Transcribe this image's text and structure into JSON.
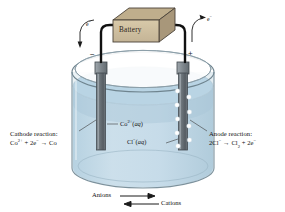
{
  "figure": {
    "background_color": "#ffffff"
  },
  "battery": {
    "label": "Battery",
    "face_color": "#cfc0a0",
    "top_color": "#bfae8c",
    "side_color": "#a8977a",
    "outline_color": "#4a4238"
  },
  "electron_flow": {
    "left_label": "e",
    "left_superscript": "−",
    "right_label": "e",
    "right_superscript": "−"
  },
  "terminals": {
    "negative": "−",
    "positive": "+"
  },
  "electrodes": {
    "cathode": {
      "name": "Cathode",
      "color": "#6e767c",
      "bubbles": false
    },
    "anode": {
      "name": "Anode",
      "color": "#6e767c",
      "bubbles": true,
      "bubble_color": "#ffffff",
      "bubble_count": 9
    }
  },
  "reactions": {
    "cathode": {
      "title": "Cathode reaction:",
      "equation_html": "Co<sup>2+</sup> + 2e<sup>−</sup> → Co",
      "equation_text": "Co2+ + 2e- → Co"
    },
    "anode": {
      "title": "Anode reaction:",
      "equation_html": "2Cl<sup>−</sup> → Cl<sub>2</sub> + 2e<sup>−</sup>",
      "equation_text": "2Cl- → Cl2 + 2e-"
    }
  },
  "solution": {
    "cation_label_html": "Co<sup>2+</sup>(<span class=\"aq\">aq</span>)",
    "cation_label_text": "Co2+(aq)",
    "anion_label_html": "Cl<sup>−</sup>(<span class=\"aq\">aq</span>)",
    "anion_label_text": "Cl-(aq)",
    "liquid_color": "#c3dae7",
    "liquid_surface_color": "#a9c9dc",
    "glass_color": "#9fb3bd"
  },
  "ion_migration": {
    "anions_label": "Anions",
    "cations_label": "Cations",
    "anions_direction": "right",
    "cations_direction": "left"
  }
}
